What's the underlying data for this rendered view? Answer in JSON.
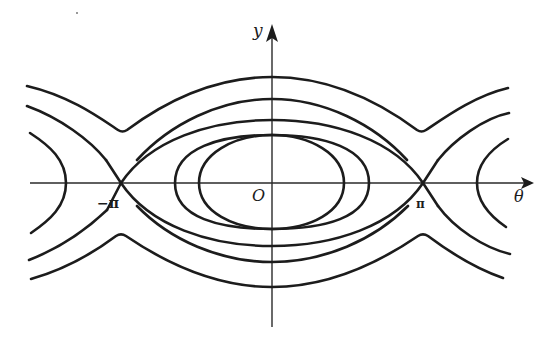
{
  "diagram": {
    "axes": {
      "horizontal_label": "θ",
      "vertical_label": "y",
      "origin_label": "O",
      "tick_labels": {
        "left_saddle": "−π",
        "right_saddle": "π"
      }
    },
    "geometry": {
      "origin_px": [
        272,
        183
      ],
      "pi_px": 151
    },
    "curves": {
      "rotating_top_outer": "M27,86 C70,96 100,118 118,130 C121,132 124,132 127,130 C170,98 220,77 272,77 C324,77 374,98 417,130 C420,132 423,132 426,130 C444,118 474,96 508,88",
      "rotating_top_inner": "M27,106 C60,118 90,140 106,160 M137,160 C170,124 220,99 272,99 C324,99 374,124 407,160 M438,160 C454,140 484,118 509,113",
      "rotating_bottom_outer": "M31,279 C70,268 100,248 116,236 C119,234 123,234 126,236 C170,266 220,287 272,287 C324,287 374,266 418,236 C421,234 425,234 428,236 C444,248 474,268 503,278",
      "rotating_bottom_inner": "M29,260 C60,248 88,228 107,210 M137,206 C170,240 220,262 272,262 C324,262 374,240 408,206 M438,206 C454,228 484,248 510,254",
      "separatrix_upper": "M106,160 L121,183 M137,160 L121,183 L137,206 M407,160 L423,183 M438,160 L423,183 L438,206 M408,206 L423,183 L107,183",
      "separatrix_main": "M121,183 C150,140 210,120 272,120 C334,120 394,140 423,183 C394,226 334,246 272,246 C210,246 150,226 121,183",
      "separatrix_wings": "M106,160 L121,183 L107,210 M438,160 L423,183 L438,206",
      "libration_outer": "M175,183 C175,148 220,135 272,135 C324,135 369,148 369,183 C369,218 324,229 272,229 C220,229 175,218 175,183",
      "libration_inner": "M199,183 C199,154 234,135 272,135 C310,135 344,154 344,183 C344,212 310,229 272,229 C234,229 199,212 199,183",
      "side_arc_left": "M30,133 C50,146 66,160 66,183 C66,206 50,220 31,233",
      "side_arc_right": "M508,139 C490,150 477,164 477,183 C477,202 490,216 506,227"
    },
    "axis_lines": {
      "horizontal": "M30,183 L527,183",
      "vertical": "M272,327 L272,34"
    },
    "arrows": {
      "theta_head": "M534,183 L521,177 L524,183 L521,189 Z",
      "y_head": "M272,24 L266,42 L272,38 L278,42 Z"
    },
    "colors": {
      "ink": "#1c1c1c",
      "background": "#ffffff"
    }
  }
}
